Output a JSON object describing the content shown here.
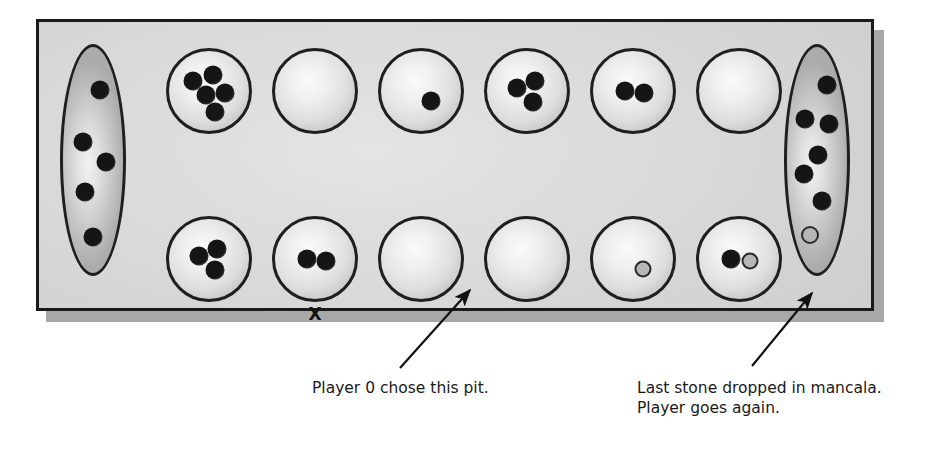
{
  "diagram": {
    "type": "mancala-board",
    "board": {
      "colors": {
        "surface": "#dcdcdc",
        "border": "#1a1a1a",
        "shadow": "#a8a8a8",
        "stone_solid": "#151515",
        "stone_hollow_fill": "#b6b6b6",
        "stone_hollow_border": "#2a2a2a"
      },
      "left_store": {
        "name": "left-mancala",
        "solid_stones": 5,
        "hollow_stones": 0,
        "total": 5
      },
      "right_store": {
        "name": "right-mancala",
        "solid_stones": 6,
        "hollow_stones": 1,
        "total": 7
      },
      "top_row": [
        {
          "index": 1,
          "solid": 5,
          "hollow": 0
        },
        {
          "index": 2,
          "solid": 0,
          "hollow": 0
        },
        {
          "index": 3,
          "solid": 1,
          "hollow": 0
        },
        {
          "index": 4,
          "solid": 3,
          "hollow": 0
        },
        {
          "index": 5,
          "solid": 2,
          "hollow": 0
        },
        {
          "index": 6,
          "solid": 0,
          "hollow": 0
        }
      ],
      "bottom_row": [
        {
          "index": 1,
          "solid": 3,
          "hollow": 0
        },
        {
          "index": 2,
          "solid": 2,
          "hollow": 0,
          "marker": "X"
        },
        {
          "index": 3,
          "solid": 0,
          "hollow": 0
        },
        {
          "index": 4,
          "solid": 0,
          "hollow": 0
        },
        {
          "index": 5,
          "solid": 0,
          "hollow": 1
        },
        {
          "index": 6,
          "solid": 1,
          "hollow": 1
        }
      ]
    },
    "marker": {
      "label": "X",
      "meaning": "marks the pit"
    },
    "annotations": [
      {
        "name": "chosen-pit-annotation",
        "text": "Player 0 chose this pit.",
        "points_to": "bottom-pit-4"
      },
      {
        "name": "mancala-annotation",
        "text": "Last stone dropped in mancala.\nPlayer goes again.",
        "points_to": "right-mancala"
      }
    ]
  }
}
